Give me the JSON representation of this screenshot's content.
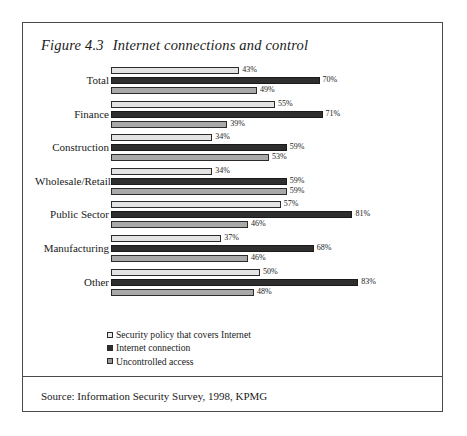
{
  "figure": {
    "number": "Figure 4.3",
    "title": "Internet connections and control",
    "source": "Source: Information Security Survey, 1998, KPMG"
  },
  "chart_data": {
    "type": "bar",
    "orientation": "horizontal",
    "xlabel": "",
    "ylabel": "",
    "xlim": [
      0,
      100
    ],
    "grid": false,
    "legend_position": "bottom-left",
    "value_suffix": "%",
    "categories": [
      "Total",
      "Finance",
      "Construction",
      "Wholesale/Retail",
      "Public Sector",
      "Manufacturing",
      "Other"
    ],
    "series": [
      {
        "name": "Security policy that covers Internet",
        "color": "#e3e3e3",
        "values": [
          43,
          55,
          34,
          34,
          57,
          37,
          50
        ],
        "labels": [
          "43%",
          "55%",
          "34%",
          "34%",
          "57%",
          "37%",
          "50%"
        ]
      },
      {
        "name": "Internet connection",
        "color": "#2e2e2e",
        "values": [
          70,
          71,
          59,
          59,
          81,
          68,
          83
        ],
        "labels": [
          "70%",
          "71%",
          "59%",
          "59%",
          "81%",
          "68%",
          "83%"
        ]
      },
      {
        "name": "Uncontrolled access",
        "color": "#a9a9a9",
        "values": [
          49,
          39,
          53,
          59,
          46,
          46,
          48
        ],
        "labels": [
          "49%",
          "39%",
          "53%",
          "59%",
          "46%",
          "46%",
          "48%"
        ]
      }
    ]
  }
}
